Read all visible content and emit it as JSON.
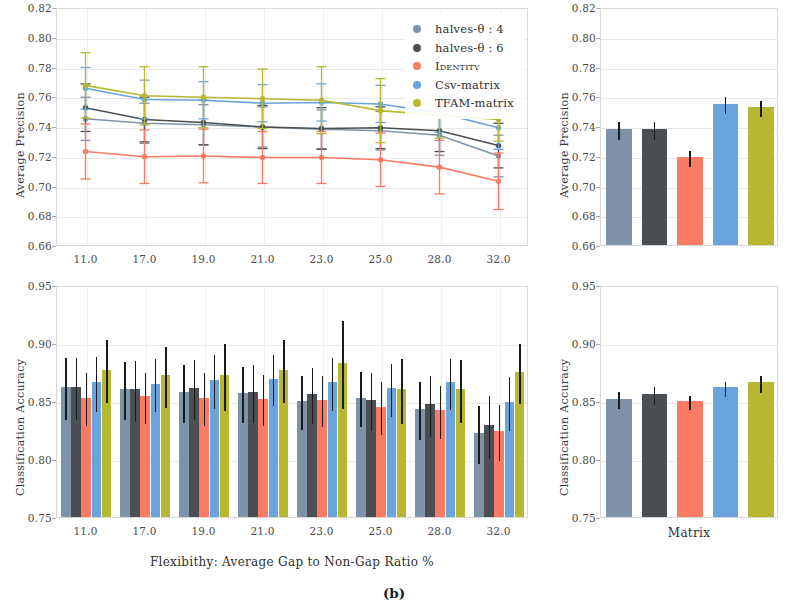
{
  "caption": "(b)",
  "legend": {
    "entries": [
      {
        "label": "halves-θ : 4",
        "color": "#7f93a8"
      },
      {
        "label": "halves-θ : 6",
        "color": "#4a4f54"
      },
      {
        "label": "Identity",
        "color": "#fa7a63"
      },
      {
        "label": "Csv-matrix",
        "color": "#6ba3dc"
      },
      {
        "label": "TFAM-matrix",
        "color": "#b5b830"
      }
    ]
  },
  "chart_data": [
    {
      "panel": "top-left",
      "type": "line",
      "title": "",
      "xlabel": "",
      "ylabel": "Average Precision",
      "categories": [
        "11.0",
        "17.0",
        "19.0",
        "21.0",
        "23.0",
        "25.0",
        "28.0",
        "32.0"
      ],
      "ylim": [
        0.66,
        0.82
      ],
      "yticks": [
        "0.82",
        "0.80",
        "0.78",
        "0.76",
        "0.74",
        "0.72",
        "0.70",
        "0.68",
        "0.66"
      ],
      "grid": true,
      "legend_position": "top-right outside",
      "series": [
        {
          "name": "halves-θ : 4",
          "color": "#7f93a8",
          "values": [
            0.7455,
            0.7425,
            0.7415,
            0.74,
            0.7385,
            0.7375,
            0.7345,
            0.7205
          ],
          "err": [
            0.0145,
            0.0135,
            0.0135,
            0.0135,
            0.013,
            0.013,
            0.0135,
            0.014
          ]
        },
        {
          "name": "halves-θ : 6",
          "color": "#4a4f54",
          "values": [
            0.753,
            0.745,
            0.743,
            0.74,
            0.739,
            0.7395,
            0.7375,
            0.7275
          ],
          "err": [
            0.016,
            0.015,
            0.015,
            0.0145,
            0.014,
            0.014,
            0.014,
            0.015
          ]
        },
        {
          "name": "Identity",
          "color": "#fa7a63",
          "values": [
            0.7235,
            0.72,
            0.7205,
            0.7195,
            0.7195,
            0.718,
            0.713,
            0.7035
          ],
          "err": [
            0.0185,
            0.018,
            0.018,
            0.0175,
            0.0175,
            0.018,
            0.018,
            0.019
          ]
        },
        {
          "name": "Csv-matrix",
          "color": "#6ba3dc",
          "values": [
            0.766,
            0.7585,
            0.758,
            0.756,
            0.7565,
            0.7555,
            0.7495,
            0.7395
          ],
          "err": [
            0.014,
            0.013,
            0.0125,
            0.0125,
            0.0125,
            0.0125,
            0.013,
            0.0145
          ]
        },
        {
          "name": "TFAM-matrix",
          "color": "#b5b830",
          "values": [
            0.768,
            0.761,
            0.76,
            0.759,
            0.758,
            0.751,
            0.748,
            0.745
          ],
          "err": [
            0.022,
            0.0195,
            0.0205,
            0.02,
            0.0225,
            0.0215,
            0.0155,
            0.0145
          ]
        }
      ]
    },
    {
      "panel": "top-right",
      "type": "bar",
      "title": "",
      "xlabel": "",
      "ylabel": "Average Precision",
      "categories": [
        "halves-θ : 4",
        "halves-θ : 6",
        "Identity",
        "Csv-matrix",
        "TFAM-matrix"
      ],
      "values": [
        0.738,
        0.7382,
        0.7192,
        0.755,
        0.7528
      ],
      "err": [
        0.0058,
        0.006,
        0.0052,
        0.0057,
        0.0055
      ],
      "colors": [
        "#7f93a8",
        "#4a4f54",
        "#fa7a63",
        "#6ba3dc",
        "#b5b830"
      ],
      "ylim": [
        0.66,
        0.82
      ],
      "yticks": [
        "0.82",
        "0.80",
        "0.78",
        "0.76",
        "0.74",
        "0.72",
        "0.70",
        "0.68",
        "0.66"
      ],
      "grid": true
    },
    {
      "panel": "bottom-left",
      "type": "bar",
      "title": "",
      "xlabel": "Flexibithy: Average Gap to Non-Gap Ratio %",
      "ylabel": "Classification Accuracy",
      "categories": [
        "11.0",
        "17.0",
        "19.0",
        "21.0",
        "23.0",
        "25.0",
        "28.0",
        "32.0"
      ],
      "ylim": [
        0.75,
        0.95
      ],
      "yticks": [
        "0.95",
        "0.90",
        "0.85",
        "0.80",
        "0.75"
      ],
      "grid": true,
      "series": [
        {
          "name": "halves-θ : 4",
          "color": "#7f93a8",
          "values": [
            0.862,
            0.86,
            0.858,
            0.857,
            0.85,
            0.853,
            0.843,
            0.822
          ],
          "err": [
            0.027,
            0.025,
            0.025,
            0.024,
            0.023,
            0.024,
            0.025,
            0.025
          ]
        },
        {
          "name": "halves-θ : 6",
          "color": "#4a4f54",
          "values": [
            0.862,
            0.86,
            0.861,
            0.858,
            0.856,
            0.851,
            0.847,
            0.829
          ],
          "err": [
            0.027,
            0.026,
            0.026,
            0.025,
            0.024,
            0.025,
            0.026,
            0.027
          ]
        },
        {
          "name": "Identity",
          "color": "#fa7a63",
          "values": [
            0.853,
            0.854,
            0.853,
            0.852,
            0.851,
            0.845,
            0.842,
            0.824
          ],
          "err": [
            0.023,
            0.022,
            0.023,
            0.022,
            0.022,
            0.023,
            0.023,
            0.024
          ]
        },
        {
          "name": "Csv-matrix",
          "color": "#6ba3dc",
          "values": [
            0.866,
            0.865,
            0.868,
            0.869,
            0.866,
            0.861,
            0.866,
            0.849
          ],
          "err": [
            0.024,
            0.023,
            0.023,
            0.022,
            0.023,
            0.023,
            0.022,
            0.023
          ]
        },
        {
          "name": "TFAM-matrix",
          "color": "#b5b830",
          "values": [
            0.877,
            0.872,
            0.872,
            0.877,
            0.883,
            0.86,
            0.86,
            0.875
          ],
          "err": [
            0.027,
            0.026,
            0.029,
            0.027,
            0.038,
            0.028,
            0.027,
            0.026
          ]
        }
      ]
    },
    {
      "panel": "bottom-right",
      "type": "bar",
      "title": "",
      "xlabel": "Matrix",
      "ylabel": "Classification Accuracy",
      "categories": [
        "halves-θ : 4",
        "halves-θ : 6",
        "Identity",
        "Csv-matrix",
        "TFAM-matrix"
      ],
      "values": [
        0.852,
        0.856,
        0.85,
        0.862,
        0.866
      ],
      "err": [
        0.0075,
        0.0075,
        0.006,
        0.0065,
        0.007
      ],
      "colors": [
        "#7f93a8",
        "#4a4f54",
        "#fa7a63",
        "#6ba3dc",
        "#b5b830"
      ],
      "ylim": [
        0.75,
        0.95
      ],
      "yticks": [
        "0.95",
        "0.90",
        "0.85",
        "0.80",
        "0.75"
      ],
      "grid": true
    }
  ]
}
